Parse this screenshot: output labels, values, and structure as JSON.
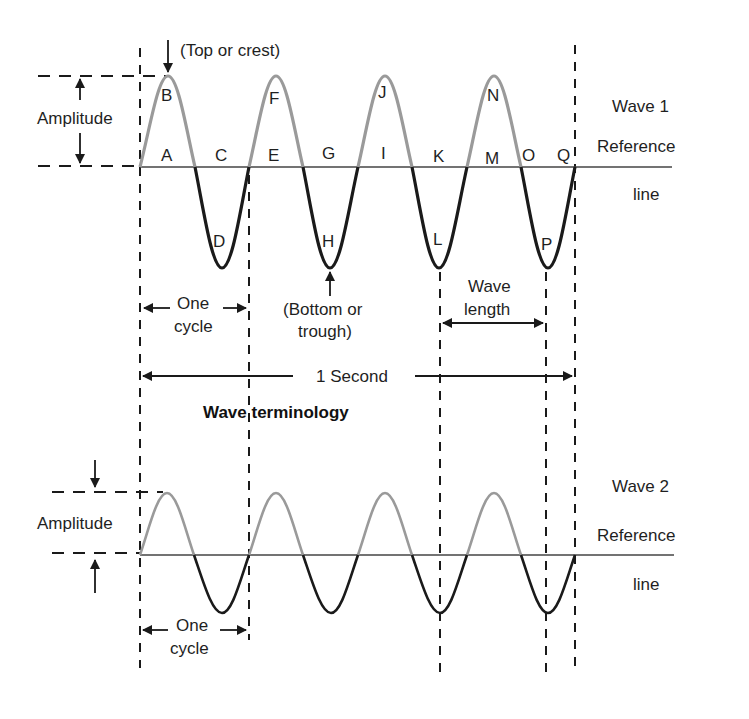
{
  "figure": {
    "title": "Wave terminology",
    "colors": {
      "crest_stroke": "#9a9a9a",
      "trough_stroke": "#1a1a1a",
      "line": "#333333",
      "background": "#ffffff"
    }
  },
  "wave1": {
    "name": "Wave 1",
    "reference_label_line1": "Reference",
    "reference_label_line2": "line",
    "amplitude_label": "Amplitude",
    "crest_label": "(Top or crest)",
    "trough_label_line1": "(Bottom or",
    "trough_label_line2": "trough)",
    "cycle_label_line1": "One",
    "cycle_label_line2": "cycle",
    "wavelength_label_line1": "Wave",
    "wavelength_label_line2": "length",
    "second_label": "1 Second",
    "cycles": 4,
    "points": {
      "A": "A",
      "B": "B",
      "C": "C",
      "D": "D",
      "E": "E",
      "F": "F",
      "G": "G",
      "H": "H",
      "I": "I",
      "J": "J",
      "K": "K",
      "L": "L",
      "M": "M",
      "N": "N",
      "O": "O",
      "P": "P",
      "Q": "Q"
    }
  },
  "wave2": {
    "name": "Wave 2",
    "reference_label_line1": "Reference",
    "reference_label_line2": "line",
    "amplitude_label": "Amplitude",
    "cycle_label_line1": "One",
    "cycle_label_line2": "cycle",
    "cycles": 4
  }
}
